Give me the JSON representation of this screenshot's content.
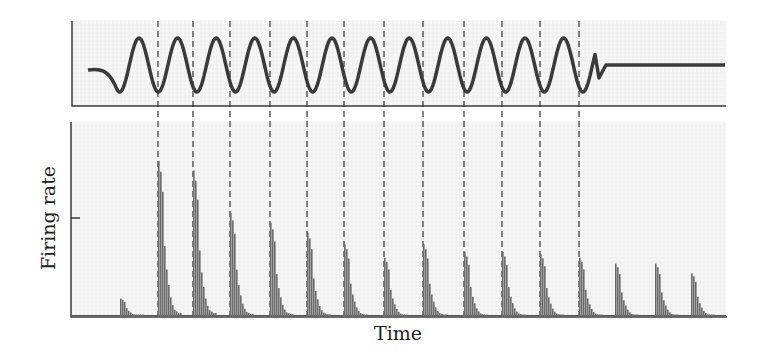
{
  "chart_data": {
    "type": "bar",
    "title": "",
    "panels": [
      {
        "name": "stimulus",
        "type": "line",
        "description": "sinusoidal stimulus waveform, 13 cycles, then flat"
      },
      {
        "name": "firing",
        "type": "bar",
        "description": "firing-rate histogram with phase-locked bursts"
      }
    ],
    "xlabel": "Time",
    "ylabel": "Firing rate",
    "burst_times_px": [
      120,
      158,
      193,
      230,
      270,
      307,
      344,
      384,
      423,
      464,
      502,
      540,
      579,
      615,
      655,
      691
    ],
    "burst_peaks_rel": [
      0.09,
      0.8,
      0.75,
      0.53,
      0.48,
      0.43,
      0.37,
      0.3,
      0.37,
      0.33,
      0.33,
      0.32,
      0.3,
      0.27,
      0.27,
      0.22
    ],
    "dashed_lines_px": [
      158,
      193,
      230,
      270,
      307,
      344,
      384,
      423,
      464,
      502,
      540,
      579
    ],
    "grid": true
  },
  "labels": {
    "x": "Time",
    "y": "Firing rate"
  },
  "colors": {
    "ink": "#3a3a3a",
    "grid": "#e4e4e4",
    "bar": "#6a6a6a"
  }
}
